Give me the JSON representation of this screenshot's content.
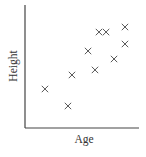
{
  "chart_data": {
    "type": "scatter",
    "title": "",
    "xlabel": "Age",
    "ylabel": "Height",
    "xlim": [
      0,
      100
    ],
    "ylim": [
      0,
      100
    ],
    "grid": false,
    "legend": null,
    "marker": "x",
    "points": [
      {
        "x": 17.5,
        "y": 31.7
      },
      {
        "x": 37.7,
        "y": 17.9
      },
      {
        "x": 41.2,
        "y": 43.1
      },
      {
        "x": 55.3,
        "y": 62.6
      },
      {
        "x": 61.4,
        "y": 47.2
      },
      {
        "x": 64.9,
        "y": 78.0
      },
      {
        "x": 71.1,
        "y": 78.0
      },
      {
        "x": 78.1,
        "y": 56.1
      },
      {
        "x": 87.7,
        "y": 82.1
      },
      {
        "x": 87.7,
        "y": 68.3
      }
    ]
  },
  "colors": {
    "axis": "#444444",
    "marker": "#444444",
    "text": "#333333"
  }
}
